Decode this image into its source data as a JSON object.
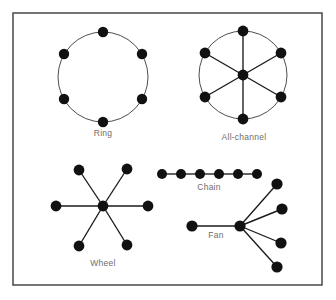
{
  "figure": {
    "background_color": "#ffffff",
    "frame": {
      "x": 13,
      "y": 13,
      "width": 309,
      "height": 272,
      "stroke_color": "#3b3b3b"
    },
    "node_color": "#111111",
    "edge_color": "#1a1a1a",
    "label_color": "#6e6e6e"
  },
  "diagrams": [
    {
      "id": "ring",
      "label": "Ring",
      "node_count": 6,
      "label_pos": {
        "x": 103,
        "y": 136
      },
      "circle": {
        "cx": 103,
        "cy": 77,
        "r": 45
      },
      "nodes": [
        {
          "x": 103,
          "y": 32,
          "r": 5.2
        },
        {
          "x": 142,
          "y": 54,
          "r": 5.2
        },
        {
          "x": 142,
          "y": 99,
          "r": 5.2
        },
        {
          "x": 103,
          "y": 122,
          "r": 5.2
        },
        {
          "x": 64,
          "y": 99,
          "r": 5.2
        },
        {
          "x": 64,
          "y": 54,
          "r": 5.2
        }
      ],
      "edges": []
    },
    {
      "id": "all-channel",
      "label": "All-channel",
      "node_count": 7,
      "label_pos": {
        "x": 244,
        "y": 140
      },
      "circle": {
        "cx": 243,
        "cy": 75,
        "r": 44
      },
      "nodes": [
        {
          "x": 243,
          "y": 31,
          "r": 5.4
        },
        {
          "x": 281,
          "y": 53,
          "r": 5.4
        },
        {
          "x": 281,
          "y": 97,
          "r": 5.4
        },
        {
          "x": 243,
          "y": 119,
          "r": 5.4
        },
        {
          "x": 205,
          "y": 97,
          "r": 5.4
        },
        {
          "x": 205,
          "y": 53,
          "r": 5.4
        },
        {
          "x": 243,
          "y": 75,
          "r": 5.4
        }
      ],
      "edges": [
        {
          "from": 0,
          "to": 3
        },
        {
          "from": 1,
          "to": 4
        },
        {
          "from": 2,
          "to": 5
        }
      ]
    },
    {
      "id": "wheel",
      "label": "Wheel",
      "node_count": 7,
      "label_pos": {
        "x": 103,
        "y": 266
      },
      "hub": {
        "x": 103,
        "y": 206,
        "r": 5.4
      },
      "nodes": [
        {
          "x": 79,
          "y": 170,
          "r": 5.4
        },
        {
          "x": 127,
          "y": 169,
          "r": 5.4
        },
        {
          "x": 148,
          "y": 206,
          "r": 5.4
        },
        {
          "x": 127,
          "y": 245,
          "r": 5.4
        },
        {
          "x": 79,
          "y": 246,
          "r": 5.4
        },
        {
          "x": 56,
          "y": 206,
          "r": 5.4
        }
      ],
      "edges": [
        {
          "from": "hub",
          "to": 0
        },
        {
          "from": "hub",
          "to": 1
        },
        {
          "from": "hub",
          "to": 2
        },
        {
          "from": "hub",
          "to": 3
        },
        {
          "from": "hub",
          "to": 4
        },
        {
          "from": "hub",
          "to": 5
        }
      ]
    },
    {
      "id": "chain",
      "label": "Chain",
      "node_count": 6,
      "label_pos": {
        "x": 209,
        "y": 190
      },
      "nodes": [
        {
          "x": 162,
          "y": 174,
          "r": 5.0
        },
        {
          "x": 181,
          "y": 174,
          "r": 5.0
        },
        {
          "x": 200,
          "y": 174,
          "r": 5.0
        },
        {
          "x": 219,
          "y": 174,
          "r": 5.0
        },
        {
          "x": 238,
          "y": 174,
          "r": 5.0
        },
        {
          "x": 257,
          "y": 174,
          "r": 5.0
        }
      ],
      "edges": [
        {
          "from": 0,
          "to": 1
        },
        {
          "from": 1,
          "to": 2
        },
        {
          "from": 2,
          "to": 3
        },
        {
          "from": 3,
          "to": 4
        },
        {
          "from": 4,
          "to": 5
        }
      ]
    },
    {
      "id": "fan",
      "label": "Fan",
      "node_count": 6,
      "label_pos": {
        "x": 216,
        "y": 238
      },
      "hub": {
        "x": 240,
        "y": 226,
        "r": 5.6
      },
      "nodes": [
        {
          "x": 192,
          "y": 226,
          "r": 5.6
        },
        {
          "x": 277,
          "y": 184,
          "r": 5.6
        },
        {
          "x": 282,
          "y": 209,
          "r": 5.6
        },
        {
          "x": 281,
          "y": 243,
          "r": 5.6
        },
        {
          "x": 277,
          "y": 267,
          "r": 5.6
        }
      ],
      "edges": [
        {
          "from": "hub",
          "to": 0
        },
        {
          "from": "hub",
          "to": 1
        },
        {
          "from": "hub",
          "to": 2
        },
        {
          "from": "hub",
          "to": 3
        },
        {
          "from": "hub",
          "to": 4
        }
      ]
    }
  ]
}
